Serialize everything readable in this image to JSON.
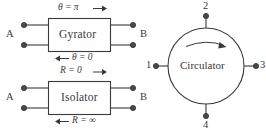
{
  "figure": {
    "stroke_color": "#3a3a3a",
    "fill_color": "#ffffff",
    "background": "#ffffff"
  },
  "gyrator": {
    "name": "Gyrator",
    "port_left_label": "A",
    "port_right_label": "B",
    "top_label": "θ = π",
    "top_arrow": "→",
    "bottom_label": "θ = 0",
    "bottom_arrow": "←"
  },
  "isolator": {
    "name": "Isolator",
    "port_left_label": "A",
    "port_right_label": "B",
    "top_label": "R = 0",
    "top_arrow": "→",
    "bottom_label": "R = ∞",
    "bottom_arrow": "←"
  },
  "circulator": {
    "name": "Circulator",
    "ports": [
      {
        "id": "1",
        "label": "1",
        "position": "left"
      },
      {
        "id": "2",
        "label": "2",
        "position": "top"
      },
      {
        "id": "3",
        "label": "3",
        "position": "right"
      },
      {
        "id": "4",
        "label": "4",
        "position": "bottom"
      }
    ],
    "rotation_arrow": "clockwise"
  }
}
